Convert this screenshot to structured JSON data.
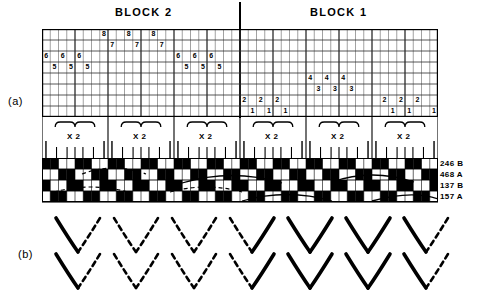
{
  "figure": {
    "part_a_label": "(a)",
    "part_b_label": "(b)"
  },
  "headings": {
    "block2": "BLOCK 2",
    "block1": "BLOCK 1"
  },
  "grid": {
    "columns": 48,
    "rows": 8,
    "repeat_label": "X 2",
    "repeat_count": 6,
    "cells": [
      {
        "col": 7,
        "row": 0,
        "value": "8"
      },
      {
        "col": 10,
        "row": 0,
        "value": "8"
      },
      {
        "col": 13,
        "row": 0,
        "value": "8"
      },
      {
        "col": 8,
        "row": 1,
        "value": "7"
      },
      {
        "col": 11,
        "row": 1,
        "value": "7"
      },
      {
        "col": 14,
        "row": 1,
        "value": "7"
      },
      {
        "col": 0,
        "row": 2,
        "value": "6"
      },
      {
        "col": 2,
        "row": 2,
        "value": "6"
      },
      {
        "col": 4,
        "row": 2,
        "value": "6"
      },
      {
        "col": 16,
        "row": 2,
        "value": "6"
      },
      {
        "col": 18,
        "row": 2,
        "value": "6"
      },
      {
        "col": 20,
        "row": 2,
        "value": "6"
      },
      {
        "col": 1,
        "row": 3,
        "value": "5"
      },
      {
        "col": 3,
        "row": 3,
        "value": "5"
      },
      {
        "col": 5,
        "row": 3,
        "value": "5"
      },
      {
        "col": 17,
        "row": 3,
        "value": "5"
      },
      {
        "col": 19,
        "row": 3,
        "value": "5"
      },
      {
        "col": 21,
        "row": 3,
        "value": "5"
      },
      {
        "col": 32,
        "row": 4,
        "value": "4"
      },
      {
        "col": 34,
        "row": 4,
        "value": "4"
      },
      {
        "col": 36,
        "row": 4,
        "value": "4"
      },
      {
        "col": 33,
        "row": 5,
        "value": "3"
      },
      {
        "col": 35,
        "row": 5,
        "value": "3"
      },
      {
        "col": 37,
        "row": 5,
        "value": "3"
      },
      {
        "col": 24,
        "row": 6,
        "value": "2"
      },
      {
        "col": 26,
        "row": 6,
        "value": "2"
      },
      {
        "col": 28,
        "row": 6,
        "value": "2"
      },
      {
        "col": 41,
        "row": 6,
        "value": "2"
      },
      {
        "col": 43,
        "row": 6,
        "value": "2"
      },
      {
        "col": 45,
        "row": 6,
        "value": "2"
      },
      {
        "col": 25,
        "row": 7,
        "value": "1"
      },
      {
        "col": 27,
        "row": 7,
        "value": "1"
      },
      {
        "col": 29,
        "row": 7,
        "value": "1"
      },
      {
        "col": 42,
        "row": 7,
        "value": "1"
      },
      {
        "col": 44,
        "row": 7,
        "value": "1"
      },
      {
        "col": 47,
        "row": 7,
        "value": "1"
      }
    ]
  },
  "weave": {
    "row_labels": [
      "246 B",
      "468 A",
      "137 B",
      "157 A"
    ],
    "columns": 48,
    "rows": 4,
    "filled": [
      [
        0,
        1,
        4,
        5,
        8,
        9,
        12,
        13,
        16,
        17,
        20,
        21,
        24,
        25,
        28,
        29,
        32,
        33,
        36,
        37,
        40,
        41,
        44,
        45
      ],
      [
        2,
        3,
        6,
        7,
        10,
        11,
        14,
        15,
        18,
        19,
        22,
        23,
        26,
        27,
        30,
        31,
        34,
        35,
        38,
        39,
        42,
        43,
        46,
        47
      ],
      [
        0,
        3,
        4,
        7,
        8,
        11,
        12,
        15,
        16,
        19,
        20,
        23,
        24,
        27,
        28,
        31,
        32,
        35,
        36,
        39,
        40,
        43,
        44,
        47
      ],
      [
        1,
        2,
        5,
        6,
        9,
        10,
        13,
        14,
        17,
        18,
        21,
        22,
        25,
        26,
        29,
        30,
        33,
        34,
        37,
        38,
        41,
        42,
        45,
        46
      ]
    ]
  },
  "chevrons": {
    "count": 7,
    "patterns": [
      {
        "left": "solid",
        "right": "dashed"
      },
      {
        "left": "dashed",
        "right": "dashed"
      },
      {
        "left": "dashed",
        "right": "dashed"
      },
      {
        "left": "dashed",
        "right": "solid"
      },
      {
        "left": "solid",
        "right": "solid"
      },
      {
        "left": "solid",
        "right": "solid"
      },
      {
        "left": "solid",
        "right": "dashed"
      }
    ]
  },
  "colors": {
    "ink": "#000000",
    "paper": "#ffffff",
    "grid_line": "#555555"
  }
}
